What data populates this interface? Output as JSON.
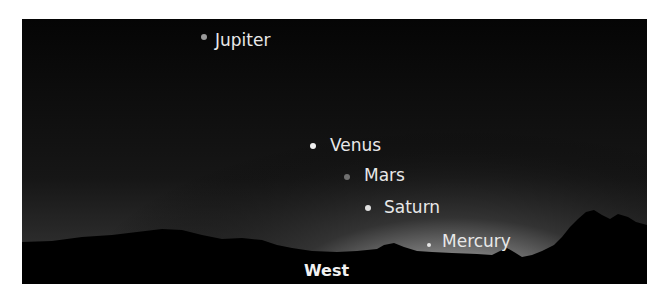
{
  "figure": {
    "direction_label": "West",
    "planets": [
      {
        "name": "Jupiter",
        "dot_color": "#9a9a9a"
      },
      {
        "name": "Venus",
        "dot_color": "#f0f0f0"
      },
      {
        "name": "Mars",
        "dot_color": "#707070"
      },
      {
        "name": "Saturn",
        "dot_color": "#e0e0e0"
      },
      {
        "name": "Mercury",
        "dot_color": "#e8e8e8"
      }
    ]
  }
}
